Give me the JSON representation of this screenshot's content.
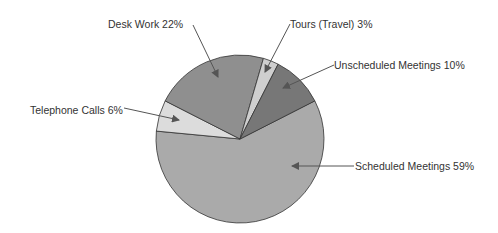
{
  "chart_data": {
    "type": "pie",
    "title": "",
    "slices": [
      {
        "label": "Scheduled Meetings",
        "value": 59,
        "color": "#aaaaaa"
      },
      {
        "label": "Telephone Calls",
        "value": 6,
        "color": "#dcdcdc"
      },
      {
        "label": "Desk Work",
        "value": 22,
        "color": "#8f8f8f"
      },
      {
        "label": "Tours (Travel)",
        "value": 3,
        "color": "#cfcfcf"
      },
      {
        "label": "Unscheduled Meetings",
        "value": 10,
        "color": "#777777"
      }
    ]
  },
  "labels": {
    "desk_work": "Desk Work 22%",
    "tours": "Tours (Travel) 3%",
    "unscheduled": "Unscheduled Meetings 10%",
    "telephone": "Telephone Calls 6%",
    "scheduled": "Scheduled Meetings 59%"
  }
}
